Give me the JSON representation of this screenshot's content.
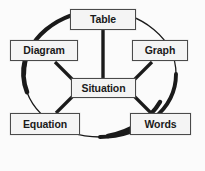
{
  "diagram": {
    "type": "concept-map",
    "background_color": "#fbfbfb",
    "stroke_color": "#1a1a1a",
    "box_fill_color": "#f4f4f4",
    "box_border_color": "#4a4a4a",
    "center": {
      "id": "situation",
      "label": "Situation"
    },
    "nodes": [
      {
        "id": "table",
        "label": "Table",
        "position": "top"
      },
      {
        "id": "diagram",
        "label": "Diagram",
        "position": "upper-left"
      },
      {
        "id": "graph",
        "label": "Graph",
        "position": "upper-right"
      },
      {
        "id": "equation",
        "label": "Equation",
        "position": "lower-left"
      },
      {
        "id": "words",
        "label": "Words",
        "position": "lower-right"
      }
    ],
    "connectors": [
      {
        "from": "situation",
        "to": "table"
      },
      {
        "from": "situation",
        "to": "diagram"
      },
      {
        "from": "situation",
        "to": "graph"
      },
      {
        "from": "situation",
        "to": "equation"
      },
      {
        "from": "situation",
        "to": "words"
      }
    ],
    "ring": {
      "shape": "circle",
      "center_x": 100,
      "center_y": 74,
      "radius_x": 76,
      "radius_y": 63,
      "stroke_style": "variable-width",
      "thick_segments": [
        "left",
        "top-left",
        "bottom-right"
      ],
      "thin_segments": [
        "right",
        "top-right",
        "bottom-left"
      ]
    }
  }
}
